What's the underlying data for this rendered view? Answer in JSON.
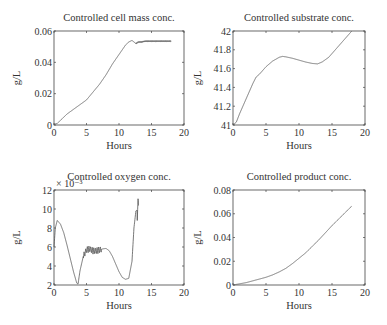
{
  "figure": {
    "width": 387,
    "height": 325,
    "line_color": "#555555",
    "frame_color": "#444444"
  },
  "chart_data": [
    {
      "type": "line",
      "title": "Controlled cell mass conc.",
      "xlabel": "Hours",
      "ylabel": "g/L",
      "xlim": [
        0,
        20
      ],
      "ylim": [
        0,
        0.06
      ],
      "xticks": [
        0,
        5,
        10,
        15,
        20
      ],
      "xtick_labels": [
        "0",
        "5",
        "10",
        "15",
        "20"
      ],
      "yticks": [
        0,
        0.02,
        0.04,
        0.06
      ],
      "ytick_labels": [
        "0",
        "0.02",
        "0.04",
        "0.06"
      ],
      "exponent_label": "",
      "grid": false,
      "box": {
        "left": 54,
        "top": 31,
        "right": 184,
        "bottom": 125
      },
      "x": [
        0,
        0.5,
        1,
        2,
        3,
        4,
        5,
        6,
        7,
        8,
        9,
        10,
        11,
        11.5,
        12,
        12.3,
        12.6,
        13,
        13.5,
        14,
        15,
        16,
        17,
        18
      ],
      "y": [
        0.0005,
        0.001,
        0.003,
        0.007,
        0.01,
        0.013,
        0.016,
        0.021,
        0.026,
        0.032,
        0.039,
        0.045,
        0.051,
        0.053,
        0.054,
        0.053,
        0.052,
        0.053,
        0.053,
        0.0535,
        0.0535,
        0.0535,
        0.0535,
        0.0535
      ],
      "oscillation": {
        "start": 12.6,
        "end": 18,
        "amplitude": 0.0004
      }
    },
    {
      "type": "line",
      "title": "Controlled substrate conc.",
      "xlabel": "Hours",
      "ylabel": "g/L",
      "xlim": [
        0,
        20
      ],
      "ylim": [
        41,
        42
      ],
      "xticks": [
        0,
        5,
        10,
        15,
        20
      ],
      "xtick_labels": [
        "0",
        "5",
        "10",
        "15",
        "20"
      ],
      "yticks": [
        41,
        41.2,
        41.4,
        41.6,
        41.8,
        42
      ],
      "ytick_labels": [
        "41",
        "41.2",
        "41.4",
        "41.6",
        "41.8",
        "42"
      ],
      "exponent_label": "",
      "grid": false,
      "box": {
        "left": 233,
        "top": 31,
        "right": 365,
        "bottom": 125
      },
      "x": [
        0,
        0.5,
        1,
        2,
        3,
        3.5,
        4,
        5,
        6,
        7,
        7.5,
        8,
        9,
        10,
        11,
        12,
        12.8,
        13.5,
        14.5,
        15,
        16,
        17,
        18
      ],
      "y": [
        41.0,
        41.03,
        41.12,
        41.28,
        41.44,
        41.51,
        41.54,
        41.62,
        41.68,
        41.72,
        41.73,
        41.725,
        41.71,
        41.69,
        41.67,
        41.655,
        41.65,
        41.67,
        41.72,
        41.76,
        41.84,
        41.92,
        42.0
      ],
      "oscillation": null
    },
    {
      "type": "line",
      "title": "Controlled oxygen conc.",
      "xlabel": "Hours",
      "ylabel": "g/L",
      "xlim": [
        0,
        20
      ],
      "ylim": [
        2,
        12
      ],
      "xticks": [
        0,
        5,
        10,
        15,
        20
      ],
      "xtick_labels": [
        "0",
        "5",
        "10",
        "15",
        "20"
      ],
      "yticks": [
        2,
        4,
        6,
        8,
        10,
        12
      ],
      "ytick_labels": [
        "2",
        "4",
        "6",
        "8",
        "10",
        "12"
      ],
      "exponent_label": "× 10⁻³",
      "grid": false,
      "box": {
        "left": 54,
        "top": 190,
        "right": 184,
        "bottom": 285
      },
      "x": [
        0,
        0.2,
        0.5,
        1,
        1.5,
        2,
        2.5,
        3,
        3.5,
        3.7,
        4,
        4.5,
        5,
        5.5,
        6,
        6.5,
        7,
        7.5,
        8,
        8.5,
        9,
        9.5,
        10,
        10.5,
        11,
        11.5,
        12,
        12.3,
        12.6,
        13
      ],
      "y": [
        6.0,
        8.0,
        8.8,
        8.4,
        7.5,
        6.2,
        4.8,
        3.4,
        2.2,
        2.1,
        3.5,
        5.0,
        5.7,
        5.8,
        5.6,
        5.6,
        5.7,
        5.8,
        5.85,
        5.6,
        5.0,
        4.2,
        3.4,
        2.8,
        2.6,
        2.7,
        4.5,
        8.0,
        9.8,
        10.0
      ],
      "oscillation_segments": [
        {
          "start": 4.5,
          "end": 7.3,
          "center": 5.7,
          "amplitude": 0.35,
          "period": 0.25
        },
        {
          "start": 12.8,
          "end": 18,
          "center": 9.6,
          "amplitude": 1.3,
          "period": 0.28
        }
      ]
    },
    {
      "type": "line",
      "title": "Controlled product conc.",
      "xlabel": "Hours",
      "ylabel": "g/L",
      "xlim": [
        0,
        20
      ],
      "ylim": [
        0,
        0.08
      ],
      "xticks": [
        0,
        5,
        10,
        15,
        20
      ],
      "xtick_labels": [
        "0",
        "5",
        "10",
        "15",
        "20"
      ],
      "yticks": [
        0,
        0.02,
        0.04,
        0.06,
        0.08
      ],
      "ytick_labels": [
        "0",
        "0.02",
        "0.04",
        "0.06",
        "0.08"
      ],
      "exponent_label": "",
      "grid": false,
      "box": {
        "left": 233,
        "top": 190,
        "right": 365,
        "bottom": 285
      },
      "x": [
        0,
        1,
        2,
        3,
        4,
        5,
        6,
        7,
        8,
        9,
        10,
        11,
        12,
        13,
        14,
        15,
        16,
        17,
        18
      ],
      "y": [
        0.0,
        0.001,
        0.002,
        0.0035,
        0.005,
        0.0065,
        0.0085,
        0.011,
        0.014,
        0.018,
        0.0225,
        0.027,
        0.0325,
        0.038,
        0.044,
        0.05,
        0.0555,
        0.061,
        0.0665
      ],
      "oscillation": null
    }
  ]
}
